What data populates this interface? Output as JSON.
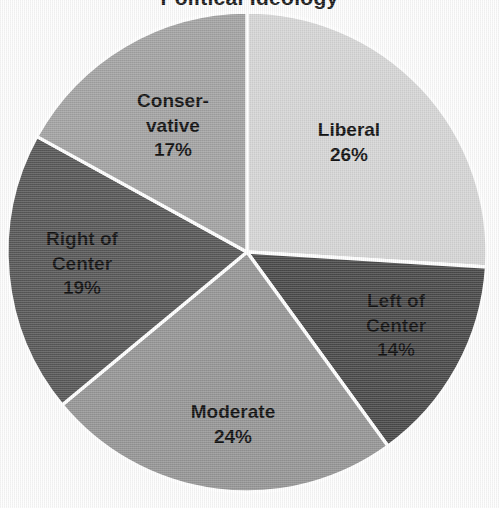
{
  "chart_data": {
    "type": "pie",
    "title": "Political Ideology",
    "title_cropped": true,
    "categories": [
      "Liberal",
      "Left of Center",
      "Moderate",
      "Right of Center",
      "Conservative"
    ],
    "values": [
      26,
      14,
      24,
      19,
      17
    ],
    "value_suffix": "%",
    "labels": [
      {
        "name": "Liberal",
        "display": "Liberal",
        "pct": "26%",
        "value": 26,
        "color": "#d6d6d6",
        "label_x": 349,
        "label_y": 143
      },
      {
        "name": "Left of Center",
        "display": "Left of\nCenter",
        "pct": "14%",
        "value": 14,
        "color": "#4a4a4a",
        "label_x": 396,
        "label_y": 326
      },
      {
        "name": "Moderate",
        "display": "Moderate",
        "pct": "24%",
        "value": 24,
        "color": "#969696",
        "label_x": 233,
        "label_y": 425
      },
      {
        "name": "Right of Center",
        "display": "Right of\nCenter",
        "pct": "19%",
        "value": 19,
        "color": "#585858",
        "label_x": 82,
        "label_y": 264
      },
      {
        "name": "Conservative",
        "display": "Conser-\nvative",
        "pct": "17%",
        "value": 17,
        "color": "#a3a3a3",
        "label_x": 173,
        "label_y": 126
      }
    ],
    "start_angle_deg": 0,
    "direction": "clockwise",
    "total": 100,
    "legend": "none",
    "data_labels": "inside",
    "slice_border_color": "#ffffff",
    "background": "#fdfdfd",
    "center_x": 247,
    "center_y": 252,
    "radius": 240
  }
}
